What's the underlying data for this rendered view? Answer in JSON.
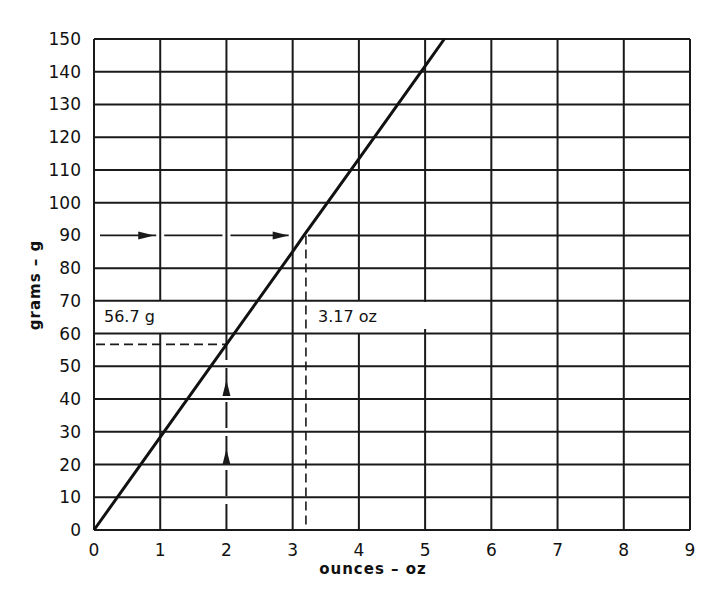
{
  "chart_data": {
    "type": "line",
    "title": "",
    "xlabel": "ounces – oz",
    "ylabel": "grams – g",
    "xlim": [
      0,
      9
    ],
    "ylim": [
      0,
      150
    ],
    "x_ticks": [
      0,
      1,
      2,
      3,
      4,
      5,
      6,
      7,
      8,
      9
    ],
    "y_ticks": [
      0,
      10,
      20,
      30,
      40,
      50,
      60,
      70,
      80,
      90,
      100,
      110,
      120,
      130,
      140,
      150
    ],
    "grid": true,
    "legend": null,
    "series": [
      {
        "name": "grams vs ounces conversion",
        "x": [
          0,
          1,
          2,
          3,
          3.17,
          4,
          5,
          5.29
        ],
        "y": [
          0,
          28.35,
          56.7,
          85.05,
          90,
          113.4,
          141.75,
          150
        ]
      }
    ],
    "annotations": [
      {
        "text": "56.7 g",
        "x": 0.15,
        "y": 65,
        "meaning": "2 oz reads as 56.7 g",
        "guide": {
          "from": [
            2,
            0
          ],
          "to": [
            2,
            56.7
          ],
          "then_to": [
            0,
            56.7
          ],
          "style": "dashed",
          "arrows": "up"
        }
      },
      {
        "text": "3.17 oz",
        "x": 3.3,
        "y": 65,
        "meaning": "90 g reads as 3.17 oz",
        "guide": {
          "from": [
            0,
            90
          ],
          "to": [
            3.17,
            90
          ],
          "then_to": [
            3.17,
            0
          ],
          "style": "dashed",
          "arrows": "right"
        }
      }
    ]
  },
  "labels": {
    "xlabel": "ounces – oz",
    "ylabel": "grams – g",
    "annot_grams": "56.7 g",
    "annot_ounces": "3.17 oz"
  },
  "style": {
    "line_color": "#111111",
    "grid_color": "#1a1a1a",
    "background": "#ffffff"
  }
}
